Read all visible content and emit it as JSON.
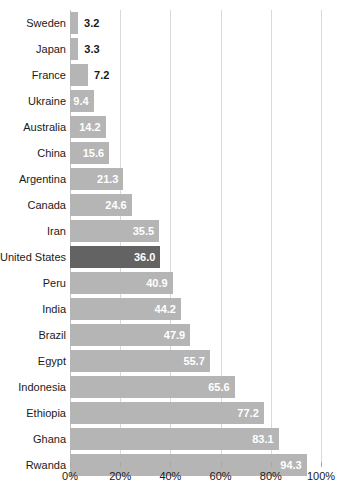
{
  "chart_data": {
    "type": "bar",
    "orientation": "horizontal",
    "title": "",
    "subtitle": "",
    "xlabel": "",
    "ylabel": "",
    "xlim": [
      0,
      100
    ],
    "grid": true,
    "legend": null,
    "value_suffix": "%",
    "highlight_category": "United States",
    "colors": {
      "bar": "#b5b5b5",
      "bar_highlight": "#636363",
      "value_label_inside": "#ffffff",
      "value_label_outside": "#1a1a1a",
      "gridline": "#d9d9d9",
      "axis": "#c2c2c2",
      "text": "#1a1a1a",
      "background": "#ffffff"
    },
    "xticks": [
      {
        "value": 0,
        "label": "0%"
      },
      {
        "value": 20,
        "label": "20%"
      },
      {
        "value": 40,
        "label": "40%"
      },
      {
        "value": 60,
        "label": "60%"
      },
      {
        "value": 80,
        "label": "80%"
      },
      {
        "value": 100,
        "label": "100%"
      }
    ],
    "categories": [
      "Sweden",
      "Japan",
      "France",
      "Ukraine",
      "Australia",
      "China",
      "Argentina",
      "Canada",
      "Iran",
      "United States",
      "Peru",
      "India",
      "Brazil",
      "Egypt",
      "Indonesia",
      "Ethiopia",
      "Ghana",
      "Rwanda"
    ],
    "values": [
      3.2,
      3.3,
      7.2,
      9.4,
      14.2,
      15.6,
      21.3,
      24.6,
      35.5,
      36.0,
      40.9,
      44.2,
      47.9,
      55.7,
      65.6,
      77.2,
      83.1,
      94.3
    ],
    "bars": [
      {
        "category": "Sweden",
        "value": 3.2,
        "label": "3.2",
        "highlight": false,
        "label_outside": true
      },
      {
        "category": "Japan",
        "value": 3.3,
        "label": "3.3",
        "highlight": false,
        "label_outside": true
      },
      {
        "category": "France",
        "value": 7.2,
        "label": "7.2",
        "highlight": false,
        "label_outside": true
      },
      {
        "category": "Ukraine",
        "value": 9.4,
        "label": "9.4",
        "highlight": false,
        "label_outside": false
      },
      {
        "category": "Australia",
        "value": 14.2,
        "label": "14.2",
        "highlight": false,
        "label_outside": false
      },
      {
        "category": "China",
        "value": 15.6,
        "label": "15.6",
        "highlight": false,
        "label_outside": false
      },
      {
        "category": "Argentina",
        "value": 21.3,
        "label": "21.3",
        "highlight": false,
        "label_outside": false
      },
      {
        "category": "Canada",
        "value": 24.6,
        "label": "24.6",
        "highlight": false,
        "label_outside": false
      },
      {
        "category": "Iran",
        "value": 35.5,
        "label": "35.5",
        "highlight": false,
        "label_outside": false
      },
      {
        "category": "United States",
        "value": 36.0,
        "label": "36.0",
        "highlight": true,
        "label_outside": false
      },
      {
        "category": "Peru",
        "value": 40.9,
        "label": "40.9",
        "highlight": false,
        "label_outside": false
      },
      {
        "category": "India",
        "value": 44.2,
        "label": "44.2",
        "highlight": false,
        "label_outside": false
      },
      {
        "category": "Brazil",
        "value": 47.9,
        "label": "47.9",
        "highlight": false,
        "label_outside": false
      },
      {
        "category": "Egypt",
        "value": 55.7,
        "label": "55.7",
        "highlight": false,
        "label_outside": false
      },
      {
        "category": "Indonesia",
        "value": 65.6,
        "label": "65.6",
        "highlight": false,
        "label_outside": false
      },
      {
        "category": "Ethiopia",
        "value": 77.2,
        "label": "77.2",
        "highlight": false,
        "label_outside": false
      },
      {
        "category": "Ghana",
        "value": 83.1,
        "label": "83.1",
        "highlight": false,
        "label_outside": false
      },
      {
        "category": "Rwanda",
        "value": 94.3,
        "label": "94.3",
        "highlight": false,
        "label_outside": false
      }
    ]
  }
}
